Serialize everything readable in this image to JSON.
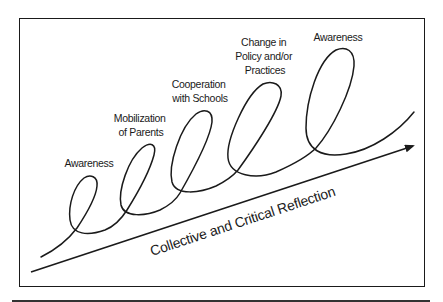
{
  "diagram": {
    "type": "spiral-progression",
    "axis_label": "Collective and Critical Reflection",
    "stages": [
      {
        "lines": [
          "Awareness"
        ]
      },
      {
        "lines": [
          "Mobilization",
          "of Parents"
        ]
      },
      {
        "lines": [
          "Cooperation",
          "with Schools"
        ]
      },
      {
        "lines": [
          "Change in",
          "Policy and/or",
          "Practices"
        ]
      },
      {
        "lines": [
          "Awareness"
        ]
      }
    ],
    "colors": {
      "ink": "#1a1a1a",
      "background": "#ffffff"
    }
  }
}
